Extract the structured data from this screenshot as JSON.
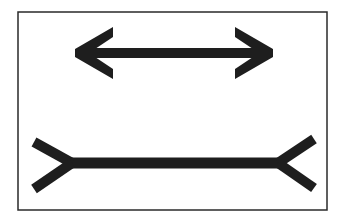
{
  "figure": {
    "name": "Müller-Lyer illusion",
    "background": "#ffffff",
    "ink_color": "#1e1e1e",
    "frame": {
      "x": 18,
      "y": 12,
      "width": 309,
      "height": 198,
      "stroke": "#2a2a2a",
      "stroke_width": 1.5
    },
    "top_figure": {
      "label": "arrowheads pointing outward",
      "shaft": {
        "x1": 80,
        "x2": 268,
        "y": 53,
        "thickness": 10
      },
      "left_tip": {
        "x": 75,
        "y": 53
      },
      "right_tip": {
        "x": 273,
        "y": 53
      },
      "arm_reach_x": 38,
      "arm_reach_y": 25,
      "arm_thickness": 9
    },
    "bottom_figure": {
      "label": "fins pointing inward (tails)",
      "shaft": {
        "x1": 72,
        "x2": 278,
        "y": 163,
        "thickness": 11
      },
      "left_vertex": {
        "x": 72,
        "y": 163
      },
      "right_vertex": {
        "x": 278,
        "y": 163
      },
      "left_fin_ends": [
        {
          "x": 34,
          "y": 142
        },
        {
          "x": 34,
          "y": 189
        }
      ],
      "right_fin_ends": [
        {
          "x": 314,
          "y": 139
        },
        {
          "x": 314,
          "y": 188
        }
      ],
      "fin_thickness": 10
    }
  }
}
